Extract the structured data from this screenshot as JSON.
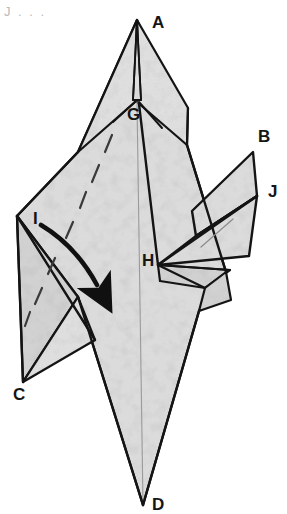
{
  "figure": {
    "kind": "origami-folding-diagram",
    "corner_note": "J . . .",
    "paper": {
      "fill_color": "#dcdcdc",
      "fill_color_shadow": "#cfcfcf",
      "fill_color_light": "#e4e4e4",
      "line_color": "#141414",
      "crease_color": "#8c8c8c",
      "background_color": "#ffffff",
      "texture": "mulberry-speckle"
    },
    "labels": [
      {
        "id": "A",
        "text": "A",
        "x": 152,
        "y": 14,
        "note": "top apex of model"
      },
      {
        "id": "G",
        "text": "G",
        "x": 127,
        "y": 106,
        "note": "inner point below apex"
      },
      {
        "id": "B",
        "text": "B",
        "x": 258,
        "y": 128,
        "note": "upper right wing tip"
      },
      {
        "id": "J",
        "text": "J",
        "x": 268,
        "y": 183,
        "note": "lower right wing tip"
      },
      {
        "id": "I",
        "text": "I",
        "x": 33,
        "y": 210,
        "note": "left flap upper corner"
      },
      {
        "id": "H",
        "text": "H",
        "x": 142,
        "y": 252,
        "note": "central right junction"
      },
      {
        "id": "C",
        "text": "C",
        "x": 13,
        "y": 386,
        "note": "lower left flap tip"
      },
      {
        "id": "D",
        "text": "D",
        "x": 152,
        "y": 496,
        "note": "bottom apex of model"
      }
    ],
    "arrow": {
      "name": "fold-direction-arrow",
      "style": "solid-curved-valley-fold",
      "color": "#101010",
      "from_label": "I",
      "toward": "center-of-body"
    },
    "crease_lines": {
      "name": "dashed-fold-lines",
      "style": "dashed",
      "count": 8,
      "color": "#3a3a3a"
    }
  }
}
